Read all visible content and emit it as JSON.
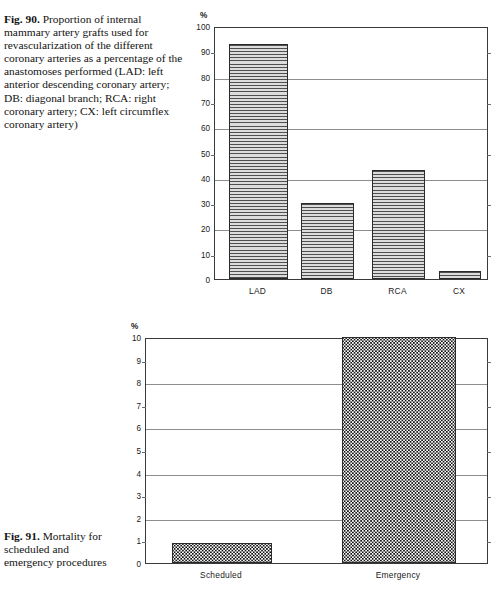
{
  "figures": [
    {
      "caption_label": "Fig. 90.",
      "caption_text": "Proportion of internal mammary artery grafts used for revascularization of the different coronary arteries as a percentage of the anastomoses performed (LAD: left anterior descending coronary artery; DB: diagonal branch; RCA: right coronary artery; CX: left circumflex coronary artery)",
      "axis_unit": "%"
    },
    {
      "caption_label": "Fig. 91.",
      "caption_text": "Mortality for scheduled and emergency procedures",
      "axis_unit": "%"
    }
  ],
  "chart_data": [
    {
      "type": "bar",
      "title": "Proportion of internal mammary artery grafts used for revascularization of the different coronary arteries as a percentage of the anastomoses performed",
      "categories": [
        "LAD",
        "DB",
        "RCA",
        "CX"
      ],
      "values": [
        93,
        30,
        43,
        3
      ],
      "xlabel": "",
      "ylabel": "%",
      "ylim": [
        0,
        100
      ],
      "yticks": [
        0,
        10,
        20,
        30,
        40,
        50,
        60,
        70,
        80,
        90,
        100
      ],
      "ytick_labels": [
        "0",
        "10",
        "20",
        "30",
        "40",
        "50",
        "60",
        "70",
        "80",
        "90",
        "100"
      ],
      "gridline_values": [
        20,
        40,
        60,
        80
      ],
      "minor_tick_values": [
        10,
        30,
        50,
        70,
        90
      ],
      "grid": true,
      "legend": "none",
      "bar_fill": "horizontal-line-hatch",
      "bar_fill_color": "#d9d9d9",
      "bar_edge_color": "#2a2a2a"
    },
    {
      "type": "bar",
      "title": "Mortality for scheduled and emergency procedures",
      "categories": [
        "Scheduled",
        "Emergency"
      ],
      "values": [
        0.9,
        10
      ],
      "xlabel": "",
      "ylabel": "%",
      "ylim": [
        0,
        10
      ],
      "yticks": [
        0,
        1,
        2,
        3,
        4,
        5,
        6,
        7,
        8,
        9,
        10
      ],
      "ytick_labels": [
        "0",
        "1",
        "2",
        "3",
        "4",
        "5",
        "6",
        "7",
        "8",
        "9",
        "10"
      ],
      "gridline_values": [
        2,
        4,
        6,
        8
      ],
      "minor_tick_values": [
        1,
        3,
        5,
        7,
        9
      ],
      "grid": true,
      "legend": "none",
      "bar_fill": "checkered-dot-hatch",
      "bar_fill_color": "#ffffff",
      "bar_edge_color": "#1c1c1c"
    }
  ]
}
